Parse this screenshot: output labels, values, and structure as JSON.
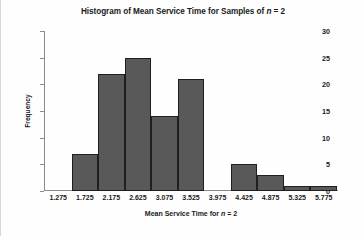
{
  "chart_data": {
    "type": "bar",
    "title": "Histogram of Mean Service Time for Samples of n = 2",
    "title_prefix": "Histogram of Mean Service Time for Samples of ",
    "title_italic": "n",
    "title_suffix": " = 2",
    "xlabel": "Mean Service Time for n = 2",
    "xlabel_prefix": "Mean Service Time for ",
    "xlabel_italic": "n",
    "xlabel_suffix": " = 2",
    "ylabel": "Frequency",
    "categories": [
      "1.275",
      "1.725",
      "2.175",
      "2.625",
      "3.075",
      "3.525",
      "3.975",
      "4.425",
      "4.875",
      "5.325",
      "5.775"
    ],
    "values": [
      0,
      7,
      22,
      25,
      14,
      21,
      0,
      5,
      3,
      1,
      1
    ],
    "ylim": [
      0,
      30
    ],
    "yticks": [
      0,
      5,
      10,
      15,
      20,
      25,
      30
    ],
    "grid": false,
    "legend": false,
    "bar_color": "#595959",
    "bar_border_color": "#1f1f1f",
    "axis_color": "#8c8c8c",
    "background": "#fefefe"
  }
}
